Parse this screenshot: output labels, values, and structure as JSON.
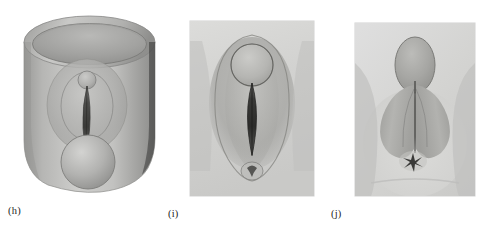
{
  "figure": {
    "background_color": "#ffffff",
    "ink_color": "#1c1c1c",
    "panel_count": 3,
    "panels": [
      {
        "id": "h",
        "caption": "(h)",
        "kind": "line-and-tone-drawing",
        "subject_name": "cylindrical-vessel-with-central-cleft",
        "frame": "none",
        "tone_color": "#a9a9a7",
        "shadow_color": "#7e7e7c",
        "highlight_color": "#d4d4d2",
        "features": [
          "open-elliptical-rim",
          "cylindrical-body",
          "oval-raised-ring",
          "vertical-central-cleft",
          "small-upper-sphere",
          "large-lower-sphere"
        ]
      },
      {
        "id": "i",
        "caption": "(i)",
        "kind": "photographic-plate",
        "subject_name": "frontal-view-vertical-cleft-with-upper-node",
        "frame": "rectangular",
        "plate_color": "#d8d8d6",
        "tone_color": "#b4b4b1",
        "shadow_color": "#6e6e6c",
        "features": [
          "rounded-upper-node",
          "elongated-vertical-cleft",
          "surrounding-oval-fold",
          "lower-puckered-opening"
        ]
      },
      {
        "id": "j",
        "caption": "(j)",
        "kind": "photographic-plate",
        "subject_name": "frontal-view-paired-lobes-with-lower-stellate-opening",
        "frame": "rectangular",
        "plate_color": "#d8d8d6",
        "tone_color": "#b0b0ad",
        "shadow_color": "#5f5f5d",
        "features": [
          "upper-oval-node",
          "paired-teardrop-lobes",
          "midline-vertical-line",
          "lower-stellate-opening"
        ]
      }
    ]
  }
}
